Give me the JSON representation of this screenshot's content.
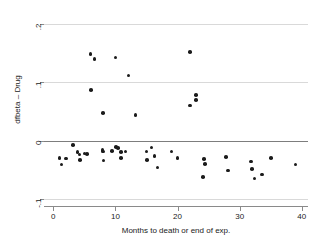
{
  "chart_data": {
    "type": "scatter",
    "title": "",
    "xlabel": "Months to death or end of exp.",
    "ylabel": "dfbeta – Drug",
    "xlim": [
      -1.5,
      41.0
    ],
    "ylim": [
      -0.112,
      0.213
    ],
    "xticks": [
      0,
      10,
      20,
      30,
      40
    ],
    "xtick_labels": [
      "0",
      "10",
      "20",
      "30",
      "40"
    ],
    "yticks": [
      0.2,
      0.1,
      0,
      -0.1
    ],
    "ytick_labels": [
      ".2",
      ".1",
      "0",
      "-.1"
    ],
    "grid": true,
    "gridlines_y": [
      0.2,
      0.1,
      -0.1
    ],
    "reference_line_y": 0,
    "legend": null,
    "marker": "filled-circle",
    "marker_color": "#1b1b1b",
    "points": [
      {
        "x": 1.0,
        "y": -0.03
      },
      {
        "x": 1.3,
        "y": -0.041
      },
      {
        "x": 2.0,
        "y": -0.031
      },
      {
        "x": 3.2,
        "y": -0.008
      },
      {
        "x": 3.9,
        "y": -0.02
      },
      {
        "x": 4.2,
        "y": -0.024
      },
      {
        "x": 4.3,
        "y": -0.033
      },
      {
        "x": 5.0,
        "y": -0.022
      },
      {
        "x": 5.4,
        "y": -0.023
      },
      {
        "x": 6.0,
        "y": 0.148
      },
      {
        "x": 6.1,
        "y": 0.086
      },
      {
        "x": 6.6,
        "y": 0.139
      },
      {
        "x": 8.0,
        "y": 0.047
      },
      {
        "x": 7.9,
        "y": -0.016
      },
      {
        "x": 8.0,
        "y": -0.019
      },
      {
        "x": 8.1,
        "y": -0.034
      },
      {
        "x": 9.4,
        "y": -0.018
      },
      {
        "x": 10.0,
        "y": 0.142
      },
      {
        "x": 10.1,
        "y": -0.011
      },
      {
        "x": 10.4,
        "y": -0.013
      },
      {
        "x": 10.9,
        "y": -0.02
      },
      {
        "x": 10.9,
        "y": -0.03
      },
      {
        "x": 11.6,
        "y": -0.019
      },
      {
        "x": 12.1,
        "y": 0.111
      },
      {
        "x": 13.2,
        "y": 0.044
      },
      {
        "x": 15.0,
        "y": -0.019
      },
      {
        "x": 15.1,
        "y": -0.033
      },
      {
        "x": 15.8,
        "y": -0.012
      },
      {
        "x": 16.3,
        "y": -0.026
      },
      {
        "x": 16.8,
        "y": -0.046
      },
      {
        "x": 19.0,
        "y": -0.019
      },
      {
        "x": 20.0,
        "y": -0.03
      },
      {
        "x": 22.0,
        "y": 0.151
      },
      {
        "x": 22.0,
        "y": 0.06
      },
      {
        "x": 23.0,
        "y": 0.078
      },
      {
        "x": 23.0,
        "y": 0.069
      },
      {
        "x": 24.3,
        "y": -0.032
      },
      {
        "x": 24.4,
        "y": -0.04
      },
      {
        "x": 24.1,
        "y": -0.062
      },
      {
        "x": 27.8,
        "y": -0.028
      },
      {
        "x": 28.1,
        "y": -0.051
      },
      {
        "x": 31.8,
        "y": -0.036
      },
      {
        "x": 32.0,
        "y": -0.049
      },
      {
        "x": 32.4,
        "y": -0.065
      },
      {
        "x": 33.6,
        "y": -0.058
      },
      {
        "x": 35.0,
        "y": -0.03
      },
      {
        "x": 39.0,
        "y": -0.041
      }
    ]
  }
}
